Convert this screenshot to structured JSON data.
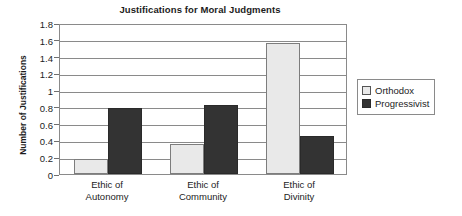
{
  "chart_data": {
    "type": "bar",
    "title": "Justifications for Moral Judgments",
    "xlabel": "",
    "ylabel": "Number of Justifications",
    "categories": [
      "Ethic of Autonomy",
      "Ethic of Community",
      "Ethic of Divinity"
    ],
    "category_lines": [
      [
        "Ethic of",
        "Autonomy"
      ],
      [
        "Ethic of",
        "Community"
      ],
      [
        "Ethic of",
        "Divinity"
      ]
    ],
    "series": [
      {
        "name": "Orthodox",
        "values": [
          0.18,
          0.36,
          1.56
        ],
        "color": "#e9e9e9"
      },
      {
        "name": "Progressivist",
        "values": [
          0.79,
          0.82,
          0.45
        ],
        "color": "#333333"
      }
    ],
    "ylim": [
      0,
      1.8
    ],
    "ytick_step": 0.2,
    "yticks": [
      "1.8",
      "1.6",
      "1.4",
      "1.2",
      "1",
      "0.8",
      "0.6",
      "0.4",
      "0.2",
      "0"
    ],
    "ytick_values": [
      1.8,
      1.6,
      1.4,
      1.2,
      1.0,
      0.8,
      0.6,
      0.4,
      0.2,
      0.0
    ],
    "grid": true,
    "legend_position": "right"
  },
  "legend": {
    "items": [
      {
        "label": "Orthodox",
        "swatch": "orthodox"
      },
      {
        "label": "Progressivist",
        "swatch": "progressivist"
      }
    ]
  }
}
